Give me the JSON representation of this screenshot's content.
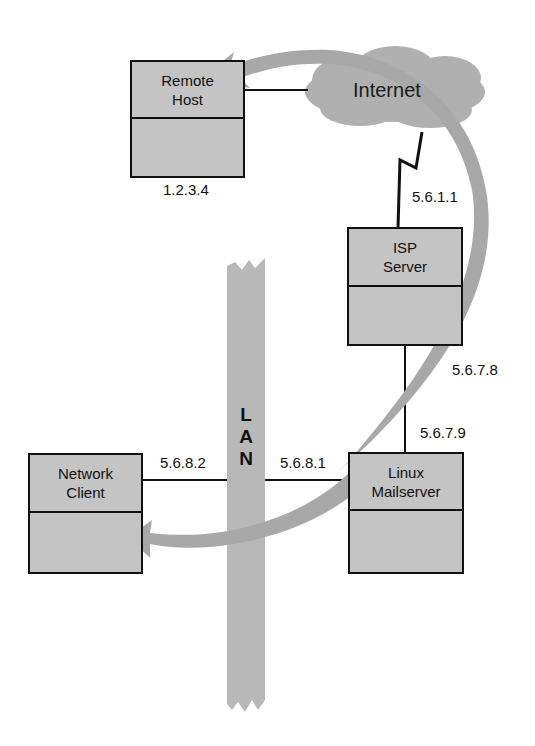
{
  "diagram": {
    "nodes": {
      "remote_host": {
        "line1": "Remote",
        "line2": "Host",
        "ip": "1.2.3.4"
      },
      "internet": {
        "label": "Internet"
      },
      "isp_server": {
        "line1": "ISP",
        "line2": "Server",
        "ip_upstream": "5.6.1.1",
        "ip_downstream": "5.6.7.8"
      },
      "linux_mailserver": {
        "line1": "Linux",
        "line2": "Mailserver",
        "ip_wan": "5.6.7.9",
        "ip_lan": "5.6.8.1"
      },
      "network_client": {
        "line1": "Network",
        "line2": "Client",
        "ip": "5.6.8.2"
      }
    },
    "lan": {
      "letters": [
        "L",
        "A",
        "N"
      ]
    },
    "colors": {
      "box_fill": "#c4c4c4",
      "arrow_fill": "#a8a8a8",
      "cloud_fill": "#b0b0b0",
      "lan_fill": "#b8b8b8",
      "line": "#111111"
    }
  }
}
